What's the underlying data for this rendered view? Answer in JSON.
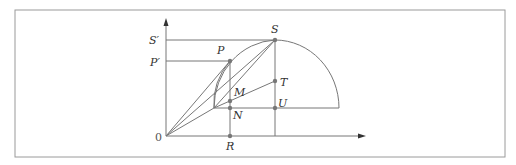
{
  "diagram": {
    "type": "geometric-construction",
    "colors": {
      "stroke": "#777777",
      "point": "#777777",
      "frame": "#999999",
      "text": "#333333"
    },
    "labels": {
      "origin": "0",
      "s_prime": "S′",
      "p_prime": "P′",
      "p": "P",
      "s": "S",
      "m": "M",
      "n": "N",
      "t": "T",
      "u": "U",
      "r": "R"
    }
  }
}
